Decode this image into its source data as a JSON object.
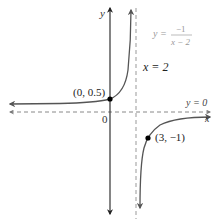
{
  "figure": {
    "equation": {
      "lhs": "y =",
      "numerator": "−1",
      "denominator": "x − 2"
    },
    "axes": {
      "x_label": "x",
      "y_label": "y",
      "origin_label": "0"
    },
    "asymptotes": {
      "vertical_label": "x = 2",
      "horizontal_label": "y = 0"
    },
    "points": [
      {
        "label": "(0, 0.5)",
        "x": 0,
        "y": 0.5
      },
      {
        "label": "(3, −1)",
        "x": 3,
        "y": -1
      }
    ],
    "colors": {
      "axis": "#333333",
      "curve": "#555555",
      "asymptote": "#888888",
      "equation_text": "#999999",
      "label_text": "#222222",
      "point": "#000000"
    }
  }
}
